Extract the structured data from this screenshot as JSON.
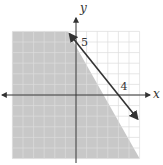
{
  "chart_data": {
    "type": "inequality-graph",
    "title": "",
    "xlabel": "x",
    "ylabel": "y",
    "xlim": [
      -6,
      6
    ],
    "ylim": [
      -6,
      6
    ],
    "grid": true,
    "boundary_line": {
      "points": [
        [
          0,
          5
        ],
        [
          4,
          0
        ]
      ],
      "equation": "5x + 4y = 20",
      "style": "solid",
      "arrows": "both"
    },
    "shaded_region": "below-left",
    "inequality": "5x + 4y <= 20",
    "annotations": [
      {
        "text": "5",
        "at": [
          0,
          5
        ],
        "meaning": "y-intercept"
      },
      {
        "text": "4",
        "at": [
          4,
          0
        ],
        "meaning": "x-intercept"
      }
    ],
    "colors": {
      "shade": "#c8c8c8",
      "grid": "#dcdcdc",
      "axis": "#333333",
      "line": "#333333"
    }
  }
}
